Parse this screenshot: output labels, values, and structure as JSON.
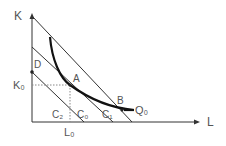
{
  "diagram": {
    "type": "isoquant-isocost",
    "axes": {
      "y_label": "K",
      "x_label": "L"
    },
    "points": [
      {
        "id": "A",
        "label": "A"
      },
      {
        "id": "B",
        "label": "B"
      },
      {
        "id": "D",
        "label": "D"
      }
    ],
    "reference": {
      "k0": "K₀",
      "l0": "L₀"
    },
    "isocost_lines": [
      {
        "id": "C2",
        "label": "C₂"
      },
      {
        "id": "C0",
        "label": "C₀"
      },
      {
        "id": "C1",
        "label": "C₁"
      }
    ],
    "isoquant": {
      "label": "Q₀"
    },
    "colors": {
      "line": "#333333",
      "curve": "#111111",
      "text": "#555555",
      "dotted": "#888888"
    }
  }
}
